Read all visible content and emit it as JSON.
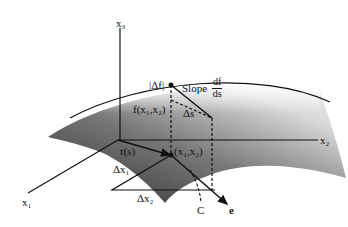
{
  "diagram": {
    "axes": {
      "x1": "x₁",
      "x2": "x₂",
      "x3": "x₃"
    },
    "labels": {
      "delta_f": "|Δf|",
      "slope_text": "Slope",
      "slope_num": "df",
      "slope_den": "ds",
      "f_value": "f(x₁,x₂)",
      "delta_s": "Δs",
      "point": "(x₁,x₂)",
      "r_s": "r(s)",
      "delta_x1": "Δx₁",
      "delta_x2": "Δx₂",
      "curve_c": "C",
      "vector_e": "e"
    },
    "colors": {
      "ink": "#111111",
      "surface_dark": "#3a3a3a",
      "surface_light": "#e8e8e8"
    }
  }
}
